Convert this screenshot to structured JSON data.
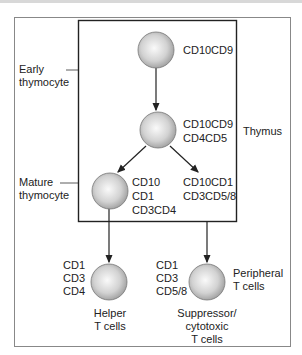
{
  "diagram": {
    "region_label": "Thymus",
    "stage_labels": {
      "early": [
        "Early",
        "thymocyte"
      ],
      "mature": [
        "Mature",
        "thymocyte"
      ]
    },
    "nodes": [
      {
        "id": "n1",
        "markers": [
          "CD10CD9"
        ]
      },
      {
        "id": "n2",
        "markers": [
          "CD10CD9",
          "CD4CD5"
        ]
      },
      {
        "id": "n3",
        "markers": [
          "CD10",
          "CD1",
          "CD3CD4"
        ]
      },
      {
        "id": "n3b",
        "markers": [
          "CD10CD1",
          "CD3CD5/8"
        ]
      },
      {
        "id": "helper",
        "markers": [
          "CD1",
          "CD3",
          "CD4"
        ],
        "name": [
          "Helper",
          "T cells"
        ]
      },
      {
        "id": "suppressor",
        "markers": [
          "CD1",
          "CD3",
          "CD5/8"
        ],
        "name": [
          "Suppressor/",
          "cytotoxic",
          "T cells"
        ]
      }
    ],
    "peripheral_label": [
      "Peripheral",
      "T cells"
    ],
    "edges": [
      [
        "n1",
        "n2"
      ],
      [
        "n2",
        "n3"
      ],
      [
        "n2",
        "n3b"
      ],
      [
        "n3",
        "helper"
      ],
      [
        "n3b",
        "suppressor"
      ]
    ]
  }
}
